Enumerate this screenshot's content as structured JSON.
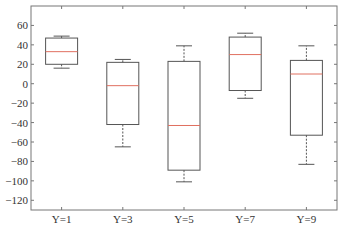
{
  "chart_data": {
    "type": "box",
    "title": "",
    "xlabel": "",
    "ylabel": "",
    "ylim": [
      -130,
      80
    ],
    "yticks": [
      60,
      40,
      20,
      0,
      -20,
      -40,
      -60,
      -80,
      -100,
      -120
    ],
    "ytick_labels": [
      "60",
      "40",
      "20",
      "0",
      "−20",
      "−40",
      "−60",
      "−80",
      "−100",
      "−120"
    ],
    "categories": [
      "Y=1",
      "Y=3",
      "Y=5",
      "Y=7",
      "Y=9"
    ],
    "grid": false,
    "legend": null,
    "boxes": [
      {
        "label": "Y=1",
        "whisker_low": 16,
        "q1": 20,
        "median": 33,
        "q3": 47,
        "whisker_high": 49
      },
      {
        "label": "Y=3",
        "whisker_low": -65,
        "q1": -42,
        "median": -2,
        "q3": 22,
        "whisker_high": 25
      },
      {
        "label": "Y=5",
        "whisker_low": -101,
        "q1": -89,
        "median": -43,
        "q3": 23,
        "whisker_high": 39
      },
      {
        "label": "Y=7",
        "whisker_low": -15,
        "q1": -7,
        "median": 30,
        "q3": 48,
        "whisker_high": 52
      },
      {
        "label": "Y=9",
        "whisker_low": -83,
        "q1": -53,
        "median": 10,
        "q3": 24,
        "whisker_high": 39
      }
    ],
    "colors": {
      "box": "#555555",
      "median": "#e07060",
      "whisker": "#555555",
      "axis": "#777777"
    }
  }
}
